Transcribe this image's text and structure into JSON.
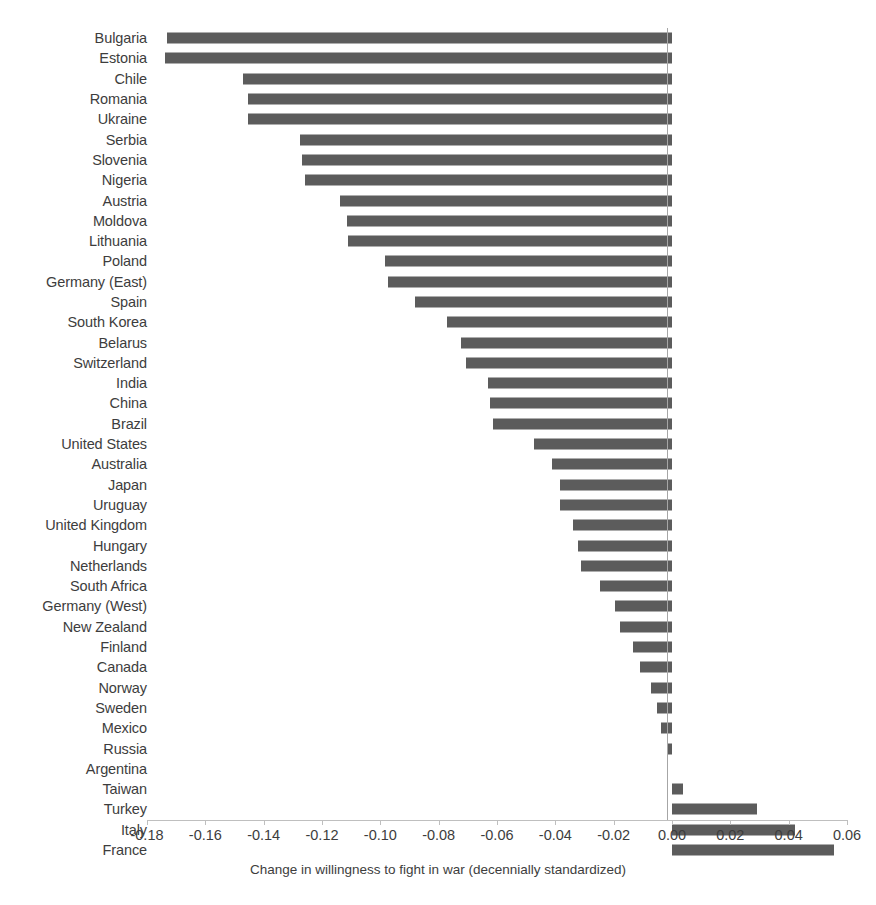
{
  "chart_data": {
    "type": "bar",
    "orientation": "horizontal",
    "title": "",
    "xlabel": "Change in willingness to fight in war (decennially standardized)",
    "ylabel": "",
    "xlim": [
      -0.18,
      0.06
    ],
    "xticks": [
      "-0.18",
      "-0.16",
      "-0.14",
      "-0.12",
      "-0.10",
      "-0.08",
      "-0.06",
      "-0.04",
      "-0.02",
      "0.00",
      "0.02",
      "0.04",
      "0.06"
    ],
    "xtick_values": [
      -0.18,
      -0.16,
      -0.14,
      -0.12,
      -0.1,
      -0.08,
      -0.06,
      -0.04,
      -0.02,
      0.0,
      0.02,
      0.04,
      0.06
    ],
    "grid": false,
    "legend": null,
    "bar_color": "#5c5c5c",
    "axis_color": "#bfbfbf",
    "categories": [
      "Bulgaria",
      "Estonia",
      "Chile",
      "Romania",
      "Ukraine",
      "Serbia",
      "Slovenia",
      "Nigeria",
      "Austria",
      "Moldova",
      "Lithuania",
      "Poland",
      "Germany (East)",
      "Spain",
      "South Korea",
      "Belarus",
      "Switzerland",
      "India",
      "China",
      "Brazil",
      "United States",
      "Australia",
      "Japan",
      "Uruguay",
      "United Kingdom",
      "Hungary",
      "Netherlands",
      "South Africa",
      "Germany (West)",
      "New Zealand",
      "Finland",
      "Canada",
      "Norway",
      "Sweden",
      "Mexico",
      "Russia",
      "Argentina",
      "Taiwan",
      "Turkey",
      "Italy",
      "France"
    ],
    "values": [
      -0.1733,
      -0.174,
      -0.147,
      -0.1453,
      -0.1453,
      -0.1277,
      -0.1267,
      -0.1257,
      -0.1137,
      -0.1113,
      -0.111,
      -0.0983,
      -0.0973,
      -0.088,
      -0.077,
      -0.0723,
      -0.0707,
      -0.063,
      -0.0623,
      -0.0613,
      -0.0473,
      -0.0413,
      -0.0383,
      -0.0383,
      -0.034,
      -0.0323,
      -0.0313,
      -0.0247,
      -0.0197,
      -0.018,
      -0.0133,
      -0.011,
      -0.0073,
      -0.0053,
      -0.0037,
      -0.0013,
      0.0,
      0.0037,
      0.029,
      0.0423,
      0.0557
    ]
  },
  "axis_title": "Change in willingness to fight in war (decennially standardized)"
}
